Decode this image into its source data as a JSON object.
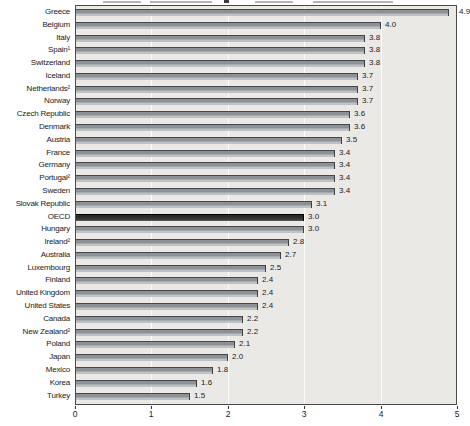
{
  "chart_data": {
    "type": "bar",
    "orientation": "horizontal",
    "title": "",
    "xlabel": "",
    "ylabel": "",
    "categories": [
      "Greece",
      "Belgium",
      "Italy",
      "Spain¹",
      "Switzerland",
      "Iceland",
      "Netherlands²",
      "Norway",
      "Czech Republic",
      "Denmark",
      "Austria",
      "France",
      "Germany",
      "Portugal²",
      "Sweden",
      "Slovak Republic",
      "OECD",
      "Hungary",
      "Ireland²",
      "Australia",
      "Luxembourg",
      "Finland",
      "United Kingdom",
      "United States",
      "Canada",
      "New Zealand²",
      "Poland",
      "Japan",
      "Mexico",
      "Korea",
      "Turkey"
    ],
    "values": [
      4.9,
      4.0,
      3.8,
      3.8,
      3.8,
      3.7,
      3.7,
      3.7,
      3.6,
      3.6,
      3.5,
      3.4,
      3.4,
      3.4,
      3.4,
      3.1,
      3.0,
      3.0,
      2.8,
      2.7,
      2.5,
      2.4,
      2.4,
      2.4,
      2.2,
      2.2,
      2.1,
      2.0,
      1.8,
      1.6,
      1.5
    ],
    "value_labels": [
      "4.9",
      "4.0",
      "3.8",
      "3.8",
      "3.8",
      "3.7",
      "3.7",
      "3.7",
      "3.6",
      "3.6",
      "3.5",
      "3.4",
      "3.4",
      "3.4",
      "3.4",
      "3.1",
      "3.0",
      "3.0",
      "2.8",
      "2.7",
      "2.5",
      "2.4",
      "2.4",
      "2.4",
      "2.2",
      "2.2",
      "2.1",
      "2.0",
      "1.8",
      "1.6",
      "1.5"
    ],
    "highlight_category": "OECD",
    "highlight_index": 16,
    "xlim": [
      0,
      5
    ],
    "xticks": [
      "0",
      "1",
      "2",
      "3",
      "4",
      "5"
    ],
    "grid": "faint white vertical gridlines at integer values",
    "legend_position": "none"
  },
  "colors": {
    "bar_fill": "#8d9195",
    "bar_edge": "#3c4043",
    "highlight_bar_fill": "#2c2c2c",
    "plot_background": "#eae9e5",
    "plot_border": "#4a4a4a",
    "text": "#1a1a1a",
    "gridline": "#ffffff",
    "page_background": "#ffffff"
  }
}
